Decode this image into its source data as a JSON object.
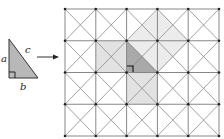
{
  "figure": {
    "small_triangle": {
      "labels": {
        "a": "a",
        "b": "b",
        "c": "c"
      },
      "fill": "#b8b8b8",
      "stroke": "#333333"
    },
    "arrow": {
      "color": "#333333"
    },
    "grid": {
      "cols": 5,
      "rows": 4,
      "x0": 65,
      "y0": 9,
      "cell_w": 30.8,
      "cell_h": 31.75,
      "line_color": "#7a7a7a",
      "diagonal_color": "#8a8a8a"
    },
    "shading": {
      "triangle_fill": "#a9a9a9",
      "square_fill": "#e4e4e4",
      "hypotenuse_square_fill": "#ececec"
    }
  }
}
